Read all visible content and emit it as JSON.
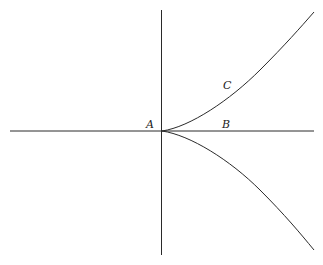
{
  "diagram": {
    "type": "semicubical-parabola-cusp",
    "labels": {
      "A": "A",
      "B": "B",
      "C": "C"
    },
    "colors": {
      "line": "#2a2a2a",
      "background": "#ffffff"
    }
  }
}
